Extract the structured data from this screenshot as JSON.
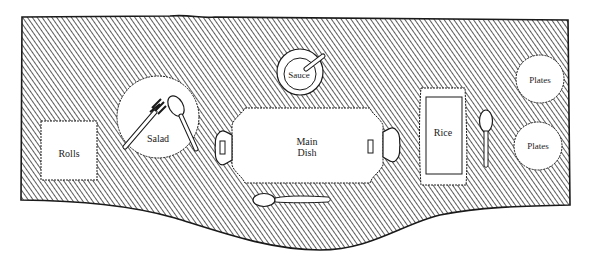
{
  "diagram": {
    "colors": {
      "background": "#ffffff",
      "table_hatch": "#555555",
      "outline": "#1a1a1a",
      "item_fill": "#ffffff",
      "text": "#222222"
    },
    "items": {
      "rolls": {
        "label": "Rolls"
      },
      "salad": {
        "label": "Salad"
      },
      "sauce": {
        "label": "Sauce"
      },
      "main_dish": {
        "label_line1": "Main",
        "label_line2": "Dish"
      },
      "rice": {
        "label": "Rice"
      },
      "plates_top": {
        "label": "Plates"
      },
      "plates_bottom": {
        "label": "Plates"
      }
    }
  }
}
